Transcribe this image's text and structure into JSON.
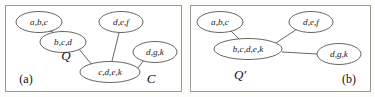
{
  "figure": {
    "caption_tags": [
      "(a)",
      "(b)"
    ],
    "colors": {
      "background": "#fdfdfb",
      "panel_fill": "#ffffff",
      "panel_border": "#9a9a96",
      "node_stroke": "#55534e",
      "edge_stroke": "#55534e",
      "text": "#19181a"
    }
  },
  "panels": [
    {
      "id": "panel-a",
      "tag": "(a)",
      "tag_x": 26,
      "tag_y": 80,
      "frame": {
        "x": 5,
        "y": 5,
        "w": 176,
        "h": 86
      },
      "set_labels": [
        {
          "name": "query-graph-label",
          "text": "Q",
          "x": 66,
          "y": 57,
          "size": 14
        },
        {
          "name": "data-graph-label",
          "text": "C",
          "x": 151,
          "y": 80,
          "size": 14
        }
      ],
      "nodes": [
        {
          "name": "node-abc",
          "label": "a,b,c",
          "cx": 39,
          "cy": 22,
          "rx": 23,
          "ry": 10.5,
          "small": false
        },
        {
          "name": "node-bcd",
          "label": "b,c,d",
          "cx": 63,
          "cy": 42,
          "rx": 23,
          "ry": 10.5,
          "small": false
        },
        {
          "name": "node-def",
          "label": "d,e,f",
          "cx": 121,
          "cy": 22,
          "rx": 22,
          "ry": 10.5,
          "small": false
        },
        {
          "name": "node-cdek",
          "label": "c,d,e,k",
          "cx": 110,
          "cy": 72,
          "rx": 30,
          "ry": 10.5,
          "small": false
        },
        {
          "name": "node-dgk",
          "label": "d,g,k",
          "cx": 155,
          "cy": 52,
          "rx": 22,
          "ry": 10.5,
          "small": false
        }
      ],
      "edges": [
        {
          "name": "edge-abc-bcd",
          "x1": 50,
          "y1": 31,
          "x2": 55,
          "y2": 33
        },
        {
          "name": "edge-bcd-cdek",
          "x1": 79,
          "y1": 49,
          "x2": 92,
          "y2": 65
        },
        {
          "name": "edge-def-cdek",
          "x1": 119,
          "y1": 33,
          "x2": 112,
          "y2": 61
        },
        {
          "name": "edge-cdek-dgk",
          "x1": 138,
          "y1": 68,
          "x2": 144,
          "y2": 60
        }
      ]
    },
    {
      "id": "panel-b",
      "tag": "(b)",
      "tag_x": 349,
      "tag_y": 80,
      "frame": {
        "x": 190,
        "y": 5,
        "w": 180,
        "h": 86
      },
      "set_labels": [
        {
          "name": "rewritten-query-label",
          "text": "Q′",
          "x": 240,
          "y": 76,
          "size": 14
        }
      ],
      "nodes": [
        {
          "name": "node-abc",
          "label": "a,b,c",
          "cx": 220,
          "cy": 22,
          "rx": 23,
          "ry": 10.5,
          "small": false
        },
        {
          "name": "node-bcdek",
          "label": "b,c,d,e,k",
          "cx": 248,
          "cy": 49,
          "rx": 34,
          "ry": 10.5,
          "small": false
        },
        {
          "name": "node-def",
          "label": "d,e,f",
          "cx": 311,
          "cy": 22,
          "rx": 22,
          "ry": 10.5,
          "small": false
        },
        {
          "name": "node-dgk",
          "label": "d,g,k",
          "cx": 339,
          "cy": 54,
          "rx": 22,
          "ry": 10.5,
          "small": false
        }
      ],
      "edges": [
        {
          "name": "edge-abc-bcdek",
          "x1": 231,
          "y1": 31,
          "x2": 239,
          "y2": 39
        },
        {
          "name": "edge-bcdek-def",
          "x1": 276,
          "y1": 43,
          "x2": 297,
          "y2": 29
        },
        {
          "name": "edge-bcdek-dgk",
          "x1": 282,
          "y1": 52,
          "x2": 317,
          "y2": 54
        }
      ]
    }
  ]
}
